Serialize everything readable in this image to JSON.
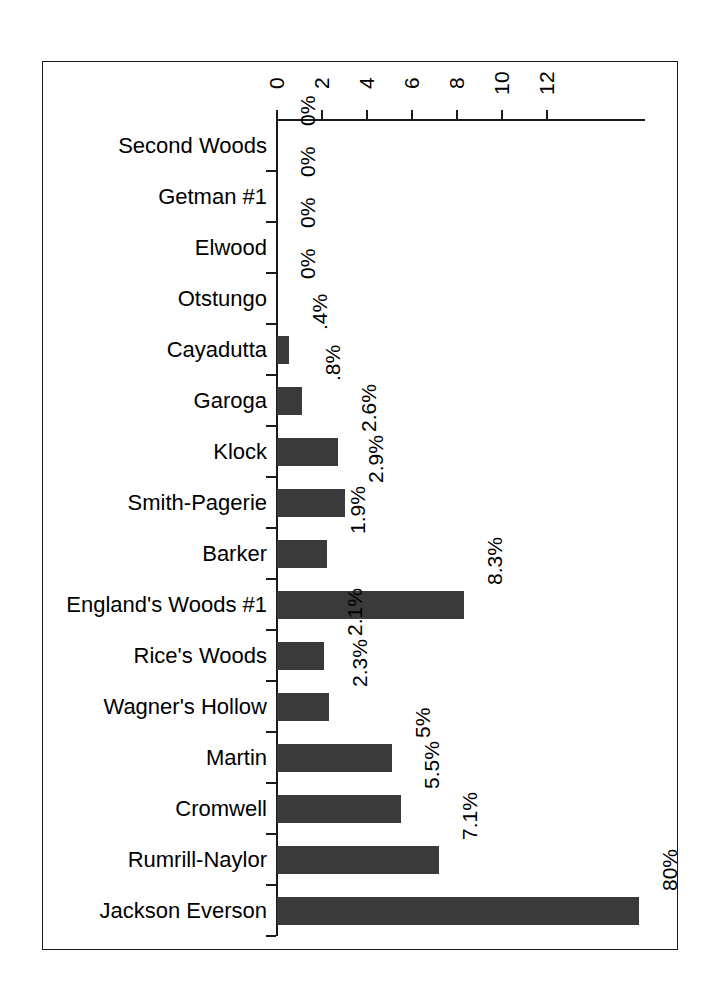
{
  "chart_data": {
    "type": "bar",
    "orientation": "horizontal",
    "title": "",
    "subtitle": "",
    "xlabel": "",
    "ylabel": "",
    "xlim": [
      0,
      16.4
    ],
    "grid": false,
    "legend": null,
    "bar_color": "#3a3a3a",
    "axis_color": "#1a1a1a",
    "xticks": [
      0,
      2,
      4,
      6,
      8,
      10,
      12
    ],
    "xtick_labels": [
      "0",
      "2",
      "4",
      "6",
      "8",
      "10",
      "12"
    ],
    "categories": [
      "Second Woods",
      "Getman #1",
      "Elwood",
      "Otstungo",
      "Cayadutta",
      "Garoga",
      "Klock",
      "Smith-Pagerie",
      "Barker",
      "England's Woods #1",
      "Rice's Woods",
      "Wagner's Hollow",
      "Martin",
      "Cromwell",
      "Rumrill-Naylor",
      "Jackson Everson"
    ],
    "values": [
      0,
      0,
      0,
      0,
      0.4,
      0.8,
      2.6,
      2.9,
      1.9,
      8.3,
      2.1,
      2.3,
      5,
      5.5,
      7.1,
      16.1
    ],
    "bar_lengths_units": [
      0,
      0,
      0,
      0,
      0.55,
      1.1,
      2.7,
      3.0,
      2.2,
      8.3,
      2.1,
      2.3,
      5.1,
      5.5,
      7.2,
      16.1
    ],
    "data_labels": [
      "0%",
      "0%",
      "0%",
      "0%",
      ".4%",
      ".8%",
      "2.6%",
      "2.9%",
      "1.9%",
      "8.3%",
      "2.1%",
      "2.3%",
      "5%",
      "5.5%",
      "7.1%",
      "80%"
    ]
  }
}
